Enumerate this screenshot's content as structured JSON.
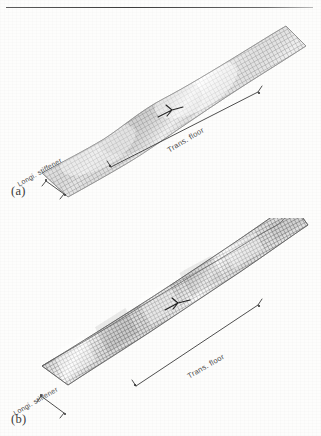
{
  "figure": {
    "caption_a": "(a)",
    "caption_b": "(b)",
    "top_rule": "horizontal-rule",
    "subfigures": [
      {
        "id": "a",
        "label": "(a)",
        "annotations": {
          "trans_floor": "Trans. floor",
          "longi_stiffener": "Longi. stiffener",
          "load_marker": "F"
        },
        "mesh": {
          "appearance": "fine-quadrilateral-grid",
          "shade": "#8e8e8e",
          "mode": "single-half-wave-buckling",
          "wave_count": 1
        }
      },
      {
        "id": "b",
        "label": "(b)",
        "annotations": {
          "trans_floor": "Trans. floor",
          "longi_stiffener": "Longi. stiffener",
          "load_marker": "F"
        },
        "mesh": {
          "appearance": "fine-quadrilateral-grid",
          "shade": "#6f6f6f",
          "mode": "multi-wave-rippled-buckling",
          "wave_count": 5
        }
      }
    ]
  },
  "colors": {
    "page_background": "#fdfdfc",
    "mesh_line_a": "#9a9a9a",
    "mesh_line_b": "#7a7a7a",
    "annotation_text": "#4a4a4a",
    "rule": "#3c3c3c"
  }
}
